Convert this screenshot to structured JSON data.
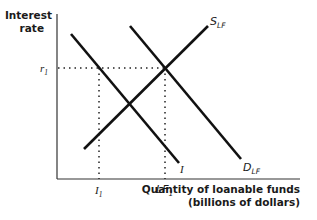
{
  "diagram": {
    "y_axis_label_line1": "Interest",
    "y_axis_label_line2": "rate",
    "x_axis_label_line1": "Quantity of loanable funds",
    "x_axis_label_line2": "(billions of dollars)",
    "y_tick": {
      "main": "r",
      "sub": "1"
    },
    "x_ticks": [
      {
        "main": "I",
        "sub": "1"
      },
      {
        "main": "LF",
        "sub": "1"
      }
    ],
    "curves": [
      {
        "name": "S",
        "sub": "LF",
        "desc": "Supply of loanable funds (upward sloping)"
      },
      {
        "name": "D",
        "sub": "LF",
        "desc": "Demand for loanable funds (downward sloping)"
      },
      {
        "name": "I",
        "sub": "",
        "desc": "Investment demand (downward sloping)"
      }
    ],
    "colors": {
      "line": "#111111",
      "background": "#ffffff"
    }
  }
}
